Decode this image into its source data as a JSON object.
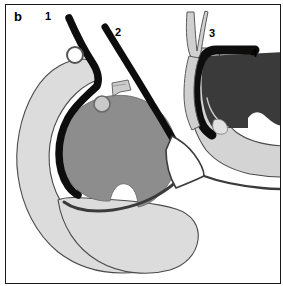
{
  "figure": {
    "panel_letter": "b",
    "type": "anatomical-line-diagram",
    "background_color": "#ffffff",
    "frame_color": "#1a1a1a"
  },
  "labels": [
    {
      "id": "1",
      "text": "1"
    },
    {
      "id": "2",
      "text": "2"
    },
    {
      "id": "3",
      "text": "3"
    },
    {
      "id": "4",
      "text": "4"
    }
  ],
  "palette": {
    "outline_dark": "#3b3b3b",
    "stroke_black": "#0d0d0d",
    "fill_pale_gray": "#dcdcdc",
    "fill_pale_gray_2": "#d4d4d4",
    "fill_mid_gray": "#8d8d8d",
    "fill_dark_gray": "#3a3a3a",
    "fill_white": "#ffffff",
    "fill_light_ring": "#c9c9c9"
  },
  "structures": [
    {
      "name": "outer-c-shaped-body",
      "description": "large pale gray crescent occupying left and lower portion",
      "fill": "#dcdcdc",
      "stroke": "#4a4a4a"
    },
    {
      "name": "central-round-mass",
      "description": "mid gray circular mass with notch at lower edge",
      "fill": "#8d8d8d",
      "stroke": "#6e6e6e"
    },
    {
      "name": "thick-black-curve-1",
      "description": "thick black band from upper left curving down around the round mass",
      "stroke": "#0d0d0d"
    },
    {
      "name": "thick-black-curve-2",
      "description": "thick black band descending diagonally from upper middle to the right",
      "stroke": "#0d0d0d"
    },
    {
      "name": "forked-instrument",
      "description": "thin two-pronged pale instrument entering from top right",
      "fill": "#d0d0d0",
      "stroke": "#5a5a5a"
    },
    {
      "name": "dark-chamber",
      "description": "dark gray filled region at upper right bounded by thick black border",
      "fill": "#3a3a3a",
      "stroke": "#0d0d0d"
    },
    {
      "name": "right-pale-band",
      "description": "pale gray band sweeping from upper right down to lower right",
      "fill": "#d4d4d4",
      "stroke": "#4a4a4a"
    },
    {
      "name": "upper-ring",
      "description": "small open circle outline near top left of the round mass",
      "fill": "#ffffff",
      "stroke": "#555555"
    },
    {
      "name": "lower-ring",
      "description": "small pale filled circle at top edge of the round mass",
      "fill": "#c9c9c9",
      "stroke": "#6a6a6a"
    },
    {
      "name": "small-flap",
      "description": "small pale wedge flap above and right of the round mass",
      "fill": "#cccccc",
      "stroke": "#5a5a5a"
    },
    {
      "name": "lower-pale-lobe",
      "description": "pale gray rounded lobe at the bottom of the figure",
      "fill": "#dcdcdc",
      "stroke": "#4a4a4a"
    },
    {
      "name": "thin-dark-tether",
      "description": "thin dark curve running from round mass toward lower right",
      "stroke": "#3b3b3b"
    }
  ]
}
